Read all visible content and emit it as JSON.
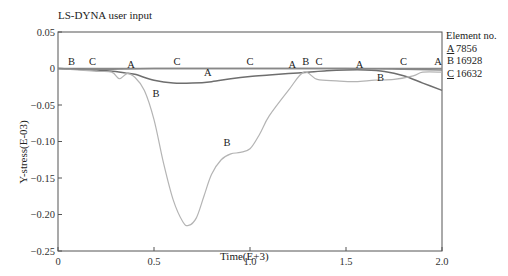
{
  "chart_data": {
    "type": "line",
    "title": "LS-DYNA user input",
    "xlabel": "Time(E+3)",
    "ylabel": "Y-stress(E-03)",
    "xlim": [
      0,
      2.0
    ],
    "ylim": [
      -0.25,
      0.05
    ],
    "xticks": [
      "0",
      "0.5",
      "1.0",
      "1.5",
      "2.0"
    ],
    "yticks": [
      "0.05",
      "0",
      "-0.05",
      "-0.10",
      "-0.15",
      "-0.20",
      "-0.25"
    ],
    "grid": false,
    "legend_title": "Element no.",
    "legend_position": "right",
    "series": [
      {
        "name": "A",
        "label": "7856",
        "color": "#6e6e6e",
        "x": [
          0,
          0.1,
          0.2,
          0.3,
          0.35,
          0.4,
          0.5,
          0.6,
          0.7,
          0.8,
          0.9,
          1.0,
          1.1,
          1.2,
          1.3,
          1.4,
          1.5,
          1.6,
          1.7,
          1.8,
          1.9,
          2.0
        ],
        "values": [
          0,
          -0.001,
          -0.002,
          -0.004,
          -0.006,
          -0.008,
          -0.016,
          -0.02,
          -0.02,
          -0.018,
          -0.014,
          -0.011,
          -0.009,
          -0.007,
          -0.005,
          -0.003,
          -0.002,
          -0.002,
          -0.004,
          -0.01,
          -0.02,
          -0.03
        ]
      },
      {
        "name": "B",
        "label": "16928",
        "color": "#b4b4b4",
        "x": [
          0,
          0.1,
          0.2,
          0.28,
          0.32,
          0.36,
          0.4,
          0.45,
          0.5,
          0.55,
          0.6,
          0.65,
          0.68,
          0.72,
          0.76,
          0.8,
          0.85,
          0.9,
          0.95,
          1.0,
          1.05,
          1.1,
          1.2,
          1.28,
          1.35,
          1.45,
          1.55,
          1.65,
          1.75,
          1.85,
          1.9,
          2.0
        ],
        "values": [
          0,
          -0.002,
          -0.004,
          -0.005,
          -0.014,
          -0.007,
          -0.012,
          -0.03,
          -0.07,
          -0.13,
          -0.18,
          -0.21,
          -0.215,
          -0.205,
          -0.175,
          -0.145,
          -0.125,
          -0.117,
          -0.115,
          -0.11,
          -0.09,
          -0.065,
          -0.03,
          -0.005,
          -0.015,
          -0.017,
          -0.018,
          -0.016,
          -0.015,
          -0.01,
          -0.005,
          -0.005
        ]
      },
      {
        "name": "C",
        "label": "16632",
        "color": "#888888",
        "x": [
          0,
          0.2,
          0.5,
          1.0,
          1.5,
          1.8,
          2.0
        ],
        "values": [
          0,
          -0.001,
          0,
          0,
          0,
          -0.001,
          -0.002
        ]
      }
    ],
    "annotations": [
      {
        "text": "B",
        "x": 0.07,
        "y": 0.004
      },
      {
        "text": "C",
        "x": 0.18,
        "y": 0.004
      },
      {
        "text": "A",
        "x": 0.38,
        "y": -0.001
      },
      {
        "text": "B",
        "x": 0.51,
        "y": -0.04
      },
      {
        "text": "C",
        "x": 0.62,
        "y": 0.004
      },
      {
        "text": "A",
        "x": 0.78,
        "y": -0.012
      },
      {
        "text": "B",
        "x": 0.88,
        "y": -0.108
      },
      {
        "text": "C",
        "x": 1.0,
        "y": 0.004
      },
      {
        "text": "A",
        "x": 1.22,
        "y": -0.001
      },
      {
        "text": "B",
        "x": 1.29,
        "y": 0.003
      },
      {
        "text": "C",
        "x": 1.36,
        "y": 0.004
      },
      {
        "text": "A",
        "x": 1.57,
        "y": 0.0
      },
      {
        "text": "B",
        "x": 1.68,
        "y": -0.018
      },
      {
        "text": "C",
        "x": 1.8,
        "y": 0.004
      },
      {
        "text": "A",
        "x": 1.98,
        "y": 0.003
      }
    ]
  },
  "legend": {
    "title": "Element no.",
    "items": [
      {
        "key": "A",
        "value": "7856"
      },
      {
        "key": "B",
        "value": "16928"
      },
      {
        "key": "C",
        "value": "16632"
      }
    ]
  }
}
